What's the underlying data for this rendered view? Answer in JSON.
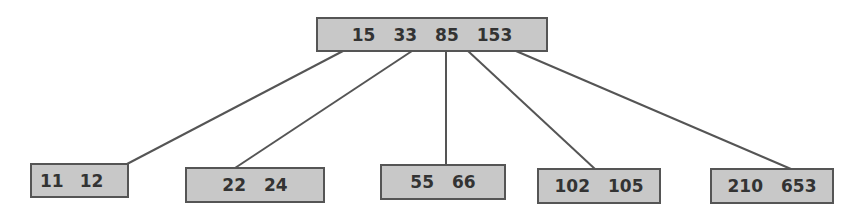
{
  "diagram": {
    "type": "b-tree",
    "colors": {
      "node_fill": "#c8c8c8",
      "node_border": "#555555",
      "edge": "#555555",
      "text": "#333333"
    },
    "root": {
      "keys": [
        "15",
        "33",
        "85",
        "153"
      ]
    },
    "leaves": [
      {
        "keys": [
          "11",
          "12"
        ]
      },
      {
        "keys": [
          "22",
          "24"
        ]
      },
      {
        "keys": [
          "55",
          "66"
        ]
      },
      {
        "keys": [
          "102",
          "105"
        ]
      },
      {
        "keys": [
          "210",
          "653"
        ]
      }
    ]
  }
}
